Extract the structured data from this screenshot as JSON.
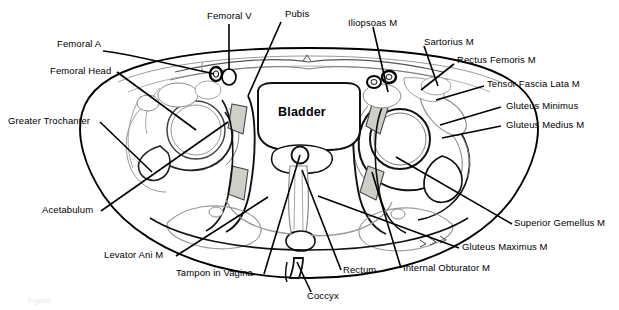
{
  "figure": {
    "type": "anatomical-cross-section",
    "region": "Female pelvis — axial CT/MRI anatomy diagram",
    "center_label": "Bladder",
    "caption": "Figure"
  },
  "labels": {
    "femoral_v": "Femoral V",
    "pubis": "Pubis",
    "iliopsoas_m": "Iliopsoas M",
    "sartorius_m": "Sartorius M",
    "rectus_femoris_m": "Rectus Femoris  M",
    "tensor_fascia_lata_m": "Tensor Fascia Lata M",
    "gluteus_minimus": "Gluteus Minimus",
    "gluteus_medius_m": "Gluteus Medius M",
    "femoral_a": "Femoral A",
    "femoral_head": "Femoral Head",
    "greater_trochanter": "Greater Trochanter",
    "acetabulum": "Acetabulum",
    "levator_ani_m": "Levator Ani M",
    "tampon_in_vagina": "Tampon in Vagina",
    "coccyx": "Coccyx",
    "rectum": "Rectum",
    "internal_obturator_m": "Internal Obturator M",
    "gluteus_maximus_m": "Gluteus Maximus M",
    "superior_gemellus_m": "Superior  Gemellus  M",
    "bladder": "Bladder"
  },
  "colors": {
    "ink": "#000000",
    "outline": "#111111",
    "faint_line": "#8a8a8a",
    "shaded_fill": "#cfcfc9",
    "background": "#ffffff"
  }
}
